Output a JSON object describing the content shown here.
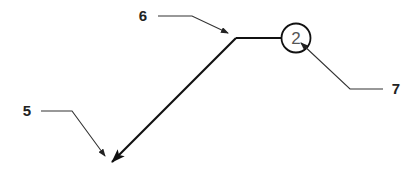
{
  "diagram": {
    "type": "patent-drawing-leader-lines",
    "labels": {
      "ref_5": "5",
      "ref_6": "6",
      "ref_7": "7",
      "circle_number": "2"
    },
    "colors": {
      "line": "#111111",
      "leader": "#333333",
      "text": "#222222",
      "circle_text": "#555555",
      "background": "#ffffff"
    },
    "elements": [
      {
        "id": "main-line",
        "description": "Bent line: horizontal segment to circle, diagonal segment ending in arrowhead at lower left"
      },
      {
        "id": "circle-2",
        "description": "Circle containing numeral 2 at the end of the horizontal segment"
      },
      {
        "id": "leader-5",
        "label": "5",
        "points_to": "arrowhead at lower-left end of diagonal"
      },
      {
        "id": "leader-6",
        "label": "6",
        "points_to": "bend between diagonal and horizontal segments"
      },
      {
        "id": "leader-7",
        "label": "7",
        "points_to": "circle-2 interior"
      }
    ]
  }
}
